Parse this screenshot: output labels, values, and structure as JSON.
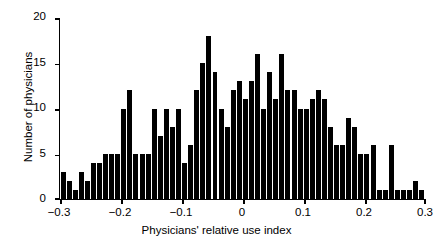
{
  "chart_data": {
    "type": "bar",
    "title": "",
    "xlabel": "Physicians' relative use index",
    "ylabel": "Number of physicians",
    "xlim": [
      -0.3,
      0.3
    ],
    "ylim": [
      0,
      20
    ],
    "grid": false,
    "legend": null,
    "bin_width": 0.01,
    "xticks": [
      "-0.3",
      "-0.2",
      "-0.1",
      "0",
      "0.1",
      "0.2",
      "0.3"
    ],
    "xtick_values": [
      -0.3,
      -0.2,
      -0.1,
      0,
      0.1,
      0.2,
      0.3
    ],
    "yticks": [
      "0",
      "5",
      "10",
      "15",
      "20"
    ],
    "ytick_values": [
      0,
      5,
      10,
      15,
      20
    ],
    "bar_color": "#000000",
    "categories": [
      "-0.300",
      "-0.290",
      "-0.280",
      "-0.270",
      "-0.260",
      "-0.250",
      "-0.240",
      "-0.230",
      "-0.220",
      "-0.210",
      "-0.200",
      "-0.190",
      "-0.180",
      "-0.170",
      "-0.160",
      "-0.150",
      "-0.140",
      "-0.130",
      "-0.120",
      "-0.110",
      "-0.100",
      "-0.090",
      "-0.080",
      "-0.070",
      "-0.060",
      "-0.050",
      "-0.040",
      "-0.030",
      "-0.020",
      "-0.010",
      "0.000",
      "0.010",
      "0.020",
      "0.030",
      "0.040",
      "0.050",
      "0.060",
      "0.070",
      "0.080",
      "0.090",
      "0.100",
      "0.110",
      "0.120",
      "0.130",
      "0.140",
      "0.150",
      "0.160",
      "0.170",
      "0.180",
      "0.190",
      "0.200",
      "0.210",
      "0.220",
      "0.230",
      "0.240",
      "0.250",
      "0.260",
      "0.270",
      "0.280",
      "0.290"
    ],
    "values": [
      3,
      2,
      1,
      3,
      2,
      4,
      4,
      5,
      5,
      5,
      10,
      12,
      5,
      5,
      5,
      10,
      7,
      10,
      8,
      10,
      4,
      6,
      12,
      15,
      18,
      14,
      10,
      8,
      12,
      13,
      11,
      13,
      16,
      10,
      14,
      11,
      16,
      12,
      12,
      10,
      10,
      11,
      12,
      11,
      8,
      6,
      6,
      9,
      8,
      5,
      5,
      6,
      1,
      1,
      6,
      1,
      1,
      1,
      2,
      1
    ]
  }
}
